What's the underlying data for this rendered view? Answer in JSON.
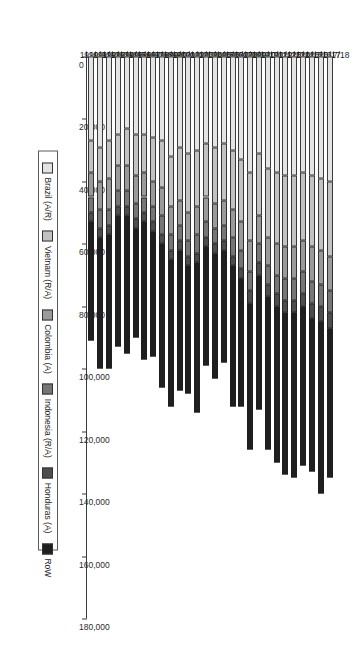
{
  "chart_data": {
    "type": "bar",
    "orientation": "horizontal-stacked",
    "title": "",
    "subtitle": "",
    "xlabel": "",
    "ylabel": "",
    "xlim": [
      0,
      180000
    ],
    "grid": false,
    "legend_position": "right",
    "tick_labels": [
      "0",
      "20,000",
      "40,000",
      "60,000",
      "80,000",
      "100,000",
      "120,000",
      "140,000",
      "160,000",
      "180,000"
    ],
    "tick_values": [
      0,
      20000,
      40000,
      60000,
      80000,
      100000,
      120000,
      140000,
      160000,
      180000
    ],
    "categories": [
      "1990/91",
      "1991/92",
      "1992/93",
      "1993/94",
      "1994/95",
      "1995/96",
      "1996/97",
      "1997/98",
      "1998/99",
      "1999/00",
      "2000/01",
      "2001/02",
      "2002/03",
      "2003/04",
      "2004/05",
      "2005/06",
      "2006/07",
      "2007/08",
      "2008/09",
      "2009/10",
      "2010/11",
      "2011/12",
      "2012/13",
      "2013/14",
      "2014/15",
      "2015/16",
      "2016/17",
      "2017/18"
    ],
    "series": [
      {
        "name": "Brazil (A/R)",
        "color": "#e4e4e4",
        "values": [
          27000,
          29000,
          27000,
          25000,
          23000,
          25000,
          25000,
          26000,
          27000,
          32000,
          29000,
          31000,
          30000,
          28000,
          29000,
          28000,
          30000,
          33000,
          37000,
          31000,
          36000,
          37000,
          38000,
          38000,
          37000,
          38000,
          39000,
          40000
        ]
      },
      {
        "name": "Vietnam (R/A)",
        "color": "#c2c2c2",
        "values": [
          10000,
          11000,
          12000,
          10000,
          12000,
          13000,
          12000,
          14000,
          15000,
          16000,
          17000,
          19000,
          18000,
          17000,
          18000,
          18000,
          19000,
          20000,
          22000,
          20000,
          22000,
          23000,
          23000,
          23000,
          22000,
          23000,
          23000,
          24000
        ]
      },
      {
        "name": "Colombia (A)",
        "color": "#9a9a9a",
        "values": [
          8000,
          9000,
          10000,
          8000,
          8000,
          9000,
          8000,
          8000,
          9000,
          9000,
          8000,
          9000,
          9000,
          8000,
          8000,
          8000,
          9000,
          9000,
          10000,
          9000,
          9000,
          10000,
          10000,
          10000,
          10000,
          11000,
          11000,
          11000
        ]
      },
      {
        "name": "Indonesia (R/A)",
        "color": "#767676",
        "values": [
          5000,
          6000,
          5000,
          5000,
          5000,
          5000,
          5000,
          5000,
          6000,
          5000,
          5000,
          5000,
          6000,
          5000,
          5000,
          5000,
          6000,
          6000,
          6000,
          6000,
          6000,
          6000,
          7000,
          7000,
          7000,
          7000,
          7000,
          7000
        ]
      },
      {
        "name": "Honduras (A)",
        "color": "#4d4d4d",
        "values": [
          3000,
          3000,
          3000,
          3000,
          3000,
          3000,
          3000,
          3000,
          3000,
          3000,
          3000,
          3000,
          3000,
          3000,
          3000,
          3000,
          3000,
          3000,
          4000,
          4000,
          4000,
          4000,
          4000,
          4000,
          4000,
          5000,
          5000,
          5000
        ]
      },
      {
        "name": "RoW",
        "color": "#1f1f1f",
        "values": [
          38000,
          42000,
          43000,
          42000,
          44000,
          35000,
          44000,
          40000,
          46000,
          47000,
          45000,
          41000,
          48000,
          38000,
          40000,
          36000,
          45000,
          41000,
          47000,
          43000,
          49000,
          50000,
          52000,
          53000,
          51000,
          49000,
          55000,
          48000
        ]
      }
    ]
  }
}
